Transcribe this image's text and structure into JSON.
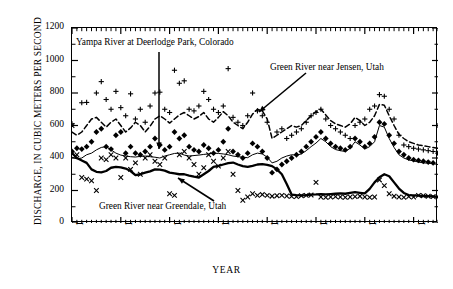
{
  "chart_data": {
    "type": "line",
    "title": "",
    "xlabel": "YEAR",
    "ylabel": "DISCHARGE, IN CUBIC METERS PER SECOND",
    "xlim": [
      1920,
      1995
    ],
    "ylim": [
      0,
      1200
    ],
    "xticks": [
      1920,
      1930,
      1940,
      1950,
      1960,
      1970,
      1980,
      1990
    ],
    "yticks": [
      0,
      200,
      400,
      600,
      800,
      1000,
      1200
    ],
    "xtick_labels": [
      "1920",
      "1930",
      "1940",
      "1950",
      "1960",
      "1970",
      "1980",
      "1990"
    ],
    "ytick_labels": [
      "0",
      "200",
      "400",
      "600",
      "800",
      "1000",
      "1200"
    ],
    "minor_tick_interval": 1,
    "grid": false,
    "legend_position": "inline-annotations",
    "x": [
      1920,
      1921,
      1922,
      1923,
      1924,
      1925,
      1926,
      1927,
      1928,
      1929,
      1930,
      1931,
      1932,
      1933,
      1934,
      1935,
      1936,
      1937,
      1938,
      1939,
      1940,
      1941,
      1942,
      1943,
      1944,
      1945,
      1946,
      1947,
      1948,
      1949,
      1950,
      1951,
      1952,
      1953,
      1954,
      1955,
      1956,
      1957,
      1958,
      1959,
      1960,
      1961,
      1962,
      1963,
      1964,
      1965,
      1966,
      1967,
      1968,
      1969,
      1970,
      1971,
      1972,
      1973,
      1974,
      1975,
      1976,
      1977,
      1978,
      1979,
      1980,
      1981,
      1982,
      1983,
      1984,
      1985,
      1986,
      1987,
      1988,
      1989,
      1990,
      1991,
      1992,
      1993,
      1994,
      1995
    ],
    "series": [
      {
        "name": "Green River near Greendale, Utah",
        "style": "thick-solid",
        "color": "#000000",
        "values": [
          430,
          400,
          385,
          370,
          330,
          315,
          312,
          320,
          340,
          345,
          342,
          335,
          320,
          295,
          300,
          310,
          318,
          330,
          328,
          322,
          310,
          305,
          300,
          300,
          292,
          285,
          280,
          300,
          320,
          345,
          352,
          360,
          368,
          372,
          360,
          350,
          345,
          352,
          360,
          362,
          358,
          350,
          330,
          300,
          240,
          175,
          172,
          170,
          172,
          175,
          176,
          178,
          176,
          178,
          180,
          182,
          180,
          185,
          190,
          186,
          182,
          210,
          250,
          282,
          300,
          288,
          250,
          212,
          185,
          172,
          170,
          168,
          166,
          165,
          164,
          160
        ]
      },
      {
        "name": "Yampa River at Deerlodge Park, Colorado",
        "style": "thin-solid",
        "color": "#000000",
        "values": [
          405,
          395,
          400,
          420,
          430,
          450,
          465,
          470,
          450,
          430,
          418,
          412,
          408,
          406,
          410,
          412,
          408,
          405,
          400,
          412,
          420,
          428,
          430,
          418,
          412,
          415,
          418,
          422,
          425,
          430,
          428,
          425,
          420,
          412,
          408,
          405,
          402,
          420,
          430,
          425,
          405,
          370,
          380,
          400,
          412,
          420,
          418,
          425,
          445,
          470,
          492,
          520,
          500,
          470,
          452,
          445,
          440,
          460,
          500,
          480,
          455,
          470,
          500,
          600,
          590,
          520,
          465,
          420,
          400,
          388,
          382,
          375,
          370,
          368,
          365,
          360
        ]
      },
      {
        "name": "Green River near Jensen, Utah",
        "style": "dashed",
        "color": "#000000",
        "values": [
          560,
          540,
          560,
          600,
          640,
          650,
          620,
          590,
          620,
          640,
          600,
          560,
          585,
          620,
          600,
          560,
          595,
          640,
          660,
          640,
          615,
          640,
          665,
          680,
          660,
          640,
          655,
          680,
          640,
          620,
          650,
          685,
          660,
          620,
          600,
          580,
          620,
          670,
          700,
          690,
          640,
          520,
          540,
          560,
          580,
          600,
          590,
          600,
          630,
          660,
          685,
          700,
          665,
          630,
          610,
          600,
          590,
          610,
          650,
          630,
          600,
          620,
          660,
          730,
          725,
          660,
          600,
          545,
          520,
          500,
          490,
          480,
          475,
          470,
          465,
          460
        ]
      }
    ],
    "scatter_sets": [
      {
        "name": "plus-markers",
        "marker": "+",
        "points": [
          [
            1920,
            610
          ],
          [
            1922,
            740
          ],
          [
            1923,
            742
          ],
          [
            1925,
            800
          ],
          [
            1926,
            870
          ],
          [
            1927,
            760
          ],
          [
            1928,
            700
          ],
          [
            1929,
            810
          ],
          [
            1930,
            710
          ],
          [
            1931,
            660
          ],
          [
            1932,
            795
          ],
          [
            1933,
            640
          ],
          [
            1934,
            700
          ],
          [
            1935,
            620
          ],
          [
            1936,
            720
          ],
          [
            1937,
            800
          ],
          [
            1938,
            805
          ],
          [
            1939,
            700
          ],
          [
            1940,
            680
          ],
          [
            1941,
            940
          ],
          [
            1942,
            860
          ],
          [
            1943,
            875
          ],
          [
            1944,
            700
          ],
          [
            1945,
            690
          ],
          [
            1946,
            720
          ],
          [
            1947,
            810
          ],
          [
            1948,
            760
          ],
          [
            1949,
            700
          ],
          [
            1950,
            680
          ],
          [
            1951,
            720
          ],
          [
            1952,
            950
          ],
          [
            1953,
            650
          ],
          [
            1954,
            620
          ],
          [
            1955,
            600
          ],
          [
            1956,
            660
          ],
          [
            1957,
            800
          ],
          [
            1958,
            690
          ],
          [
            1959,
            660
          ],
          [
            1960,
            620
          ],
          [
            1962,
            560
          ],
          [
            1963,
            580
          ],
          [
            1964,
            520
          ],
          [
            1965,
            540
          ],
          [
            1966,
            560
          ],
          [
            1967,
            580
          ],
          [
            1968,
            620
          ],
          [
            1969,
            660
          ],
          [
            1970,
            680
          ],
          [
            1971,
            700
          ],
          [
            1972,
            640
          ],
          [
            1973,
            600
          ],
          [
            1974,
            580
          ],
          [
            1975,
            560
          ],
          [
            1976,
            540
          ],
          [
            1977,
            520
          ],
          [
            1978,
            600
          ],
          [
            1979,
            620
          ],
          [
            1980,
            640
          ],
          [
            1981,
            700
          ],
          [
            1982,
            720
          ],
          [
            1983,
            790
          ],
          [
            1984,
            780
          ],
          [
            1985,
            700
          ],
          [
            1986,
            640
          ],
          [
            1987,
            540
          ],
          [
            1988,
            480
          ],
          [
            1989,
            470
          ],
          [
            1990,
            460
          ],
          [
            1991,
            455
          ],
          [
            1992,
            450
          ],
          [
            1993,
            445
          ],
          [
            1994,
            440
          ],
          [
            1995,
            600
          ]
        ]
      },
      {
        "name": "diamond-markers",
        "marker": "diamond",
        "points": [
          [
            1920,
            440
          ],
          [
            1921,
            460
          ],
          [
            1922,
            455
          ],
          [
            1923,
            470
          ],
          [
            1924,
            500
          ],
          [
            1925,
            560
          ],
          [
            1926,
            580
          ],
          [
            1927,
            470
          ],
          [
            1928,
            455
          ],
          [
            1929,
            540
          ],
          [
            1930,
            560
          ],
          [
            1931,
            430
          ],
          [
            1932,
            470
          ],
          [
            1933,
            430
          ],
          [
            1934,
            420
          ],
          [
            1935,
            440
          ],
          [
            1936,
            470
          ],
          [
            1937,
            520
          ],
          [
            1938,
            480
          ],
          [
            1939,
            450
          ],
          [
            1940,
            470
          ],
          [
            1941,
            560
          ],
          [
            1942,
            520
          ],
          [
            1943,
            540
          ],
          [
            1944,
            470
          ],
          [
            1945,
            450
          ],
          [
            1946,
            440
          ],
          [
            1947,
            480
          ],
          [
            1948,
            460
          ],
          [
            1949,
            430
          ],
          [
            1950,
            450
          ],
          [
            1951,
            500
          ],
          [
            1952,
            580
          ],
          [
            1953,
            440
          ],
          [
            1954,
            420
          ],
          [
            1955,
            400
          ],
          [
            1956,
            430
          ],
          [
            1957,
            490
          ],
          [
            1958,
            470
          ],
          [
            1959,
            440
          ],
          [
            1960,
            400
          ],
          [
            1961,
            310
          ],
          [
            1962,
            330
          ],
          [
            1963,
            360
          ],
          [
            1964,
            380
          ],
          [
            1965,
            400
          ],
          [
            1966,
            420
          ],
          [
            1967,
            440
          ],
          [
            1968,
            470
          ],
          [
            1969,
            500
          ],
          [
            1970,
            530
          ],
          [
            1971,
            560
          ],
          [
            1972,
            520
          ],
          [
            1973,
            490
          ],
          [
            1974,
            470
          ],
          [
            1975,
            460
          ],
          [
            1976,
            450
          ],
          [
            1977,
            470
          ],
          [
            1978,
            520
          ],
          [
            1979,
            500
          ],
          [
            1980,
            470
          ],
          [
            1981,
            490
          ],
          [
            1982,
            530
          ],
          [
            1983,
            620
          ],
          [
            1984,
            610
          ],
          [
            1985,
            540
          ],
          [
            1986,
            490
          ],
          [
            1987,
            440
          ],
          [
            1988,
            420
          ],
          [
            1989,
            400
          ],
          [
            1990,
            390
          ],
          [
            1991,
            385
          ],
          [
            1992,
            380
          ],
          [
            1993,
            375
          ],
          [
            1994,
            370
          ],
          [
            1995,
            430
          ]
        ]
      },
      {
        "name": "x-markers",
        "marker": "x",
        "points": [
          [
            1920,
            600
          ],
          [
            1921,
            420
          ],
          [
            1922,
            280
          ],
          [
            1923,
            270
          ],
          [
            1924,
            260
          ],
          [
            1925,
            200
          ],
          [
            1926,
            400
          ],
          [
            1927,
            390
          ],
          [
            1928,
            420
          ],
          [
            1929,
            400
          ],
          [
            1930,
            280
          ],
          [
            1931,
            400
          ],
          [
            1932,
            330
          ],
          [
            1933,
            370
          ],
          [
            1934,
            300
          ],
          [
            1935,
            400
          ],
          [
            1936,
            420
          ],
          [
            1937,
            380
          ],
          [
            1938,
            360
          ],
          [
            1939,
            400
          ],
          [
            1940,
            180
          ],
          [
            1941,
            170
          ],
          [
            1942,
            420
          ],
          [
            1943,
            440
          ],
          [
            1944,
            400
          ],
          [
            1945,
            360
          ],
          [
            1946,
            300
          ],
          [
            1947,
            340
          ],
          [
            1948,
            420
          ],
          [
            1949,
            380
          ],
          [
            1950,
            350
          ],
          [
            1951,
            400
          ],
          [
            1952,
            440
          ],
          [
            1953,
            300
          ],
          [
            1954,
            200
          ],
          [
            1955,
            140
          ],
          [
            1956,
            160
          ],
          [
            1957,
            180
          ],
          [
            1958,
            170
          ],
          [
            1959,
            175
          ],
          [
            1960,
            170
          ],
          [
            1961,
            165
          ],
          [
            1962,
            168
          ],
          [
            1963,
            170
          ],
          [
            1964,
            166
          ],
          [
            1965,
            164
          ],
          [
            1966,
            162
          ],
          [
            1967,
            168
          ],
          [
            1968,
            170
          ],
          [
            1969,
            172
          ],
          [
            1970,
            250
          ],
          [
            1971,
            160
          ],
          [
            1972,
            158
          ],
          [
            1973,
            160
          ],
          [
            1974,
            162
          ],
          [
            1975,
            160
          ],
          [
            1976,
            158
          ],
          [
            1977,
            160
          ],
          [
            1978,
            162
          ],
          [
            1979,
            165
          ],
          [
            1980,
            160
          ],
          [
            1981,
            158
          ],
          [
            1982,
            160
          ],
          [
            1983,
            265
          ],
          [
            1984,
            230
          ],
          [
            1985,
            180
          ],
          [
            1986,
            165
          ],
          [
            1987,
            160
          ],
          [
            1988,
            158
          ],
          [
            1989,
            162
          ],
          [
            1990,
            160
          ],
          [
            1991,
            170
          ],
          [
            1992,
            168
          ],
          [
            1993,
            165
          ],
          [
            1994,
            162
          ],
          [
            1995,
            160
          ]
        ]
      }
    ],
    "annotations": [
      {
        "name": "yampa",
        "text": "Yampa River at Deerlodge Park, Colorado",
        "arrow": "down"
      },
      {
        "name": "jensen",
        "text": "Green River near Jensen, Utah",
        "arrow": "down-left"
      },
      {
        "name": "greendale",
        "text": "Green River near Greendale, Utah",
        "arrow": "up-left"
      }
    ]
  }
}
